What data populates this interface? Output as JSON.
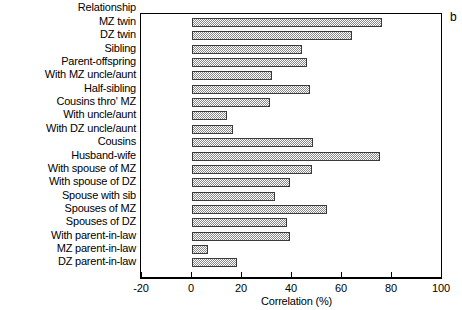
{
  "panel_label": "b",
  "category_axis_header": "Relationship",
  "chart_data": {
    "type": "bar",
    "orientation": "horizontal",
    "title": "",
    "panel_letter": "b",
    "xlabel": "Correlation (%)",
    "ylabel": "Relationship",
    "xlim": [
      -20,
      100
    ],
    "xticks": [
      -20,
      0,
      20,
      40,
      60,
      80,
      100
    ],
    "xticklabels": [
      "-20",
      "0",
      "20",
      "40",
      "60",
      "80",
      "100"
    ],
    "grid": false,
    "legend": false,
    "bar_fill": "gray-checker-hatch",
    "bar_edge_color": "#3a3a3a",
    "categories": [
      "MZ twin",
      "DZ twin",
      "Sibling",
      "Parent-offspring",
      "With MZ uncle/aunt",
      "Half-sibling",
      "Cousins thro' MZ",
      "With uncle/aunt",
      "With DZ uncle/aunt",
      "Cousins",
      "Husband-wife",
      "With spouse of MZ",
      "With spouse of DZ",
      "Spouse with sib",
      "Spouses of MZ",
      "Spouses of DZ",
      "With parent-in-law",
      "MZ parent-in-law",
      "DZ parent-in-law"
    ],
    "values": [
      76,
      64,
      44,
      46,
      32,
      47,
      31,
      14,
      16.5,
      48.5,
      75,
      48,
      39,
      33,
      54,
      38,
      39,
      6.5,
      18
    ]
  }
}
